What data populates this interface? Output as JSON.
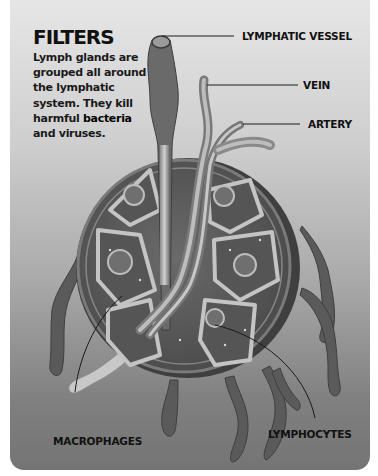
{
  "panel": {
    "heading": "FILTERS",
    "body_prefix": "Lymph glands are grouped all around the lymphatic system. They kill harmful ",
    "body_bold": "bacteria",
    "body_suffix": " and viruses."
  },
  "labels": {
    "lymphatic_vessel": "LYMPHATIC VESSEL",
    "vein": "VEIN",
    "artery": "ARTERY",
    "macrophages": "MACROPHAGES",
    "lymphocytes": "LYMPHOCYTES"
  },
  "illustration": {
    "subject": "lymph-gland-cross-section",
    "colors": {
      "background_top": "#e6e6e6",
      "background_bottom": "#747474",
      "gland_fill": "#5e5e5e",
      "gland_capsule": "#6e6e6e",
      "tissue_light": "#c9c9c9",
      "leader_line": "#1a1a1a"
    }
  }
}
